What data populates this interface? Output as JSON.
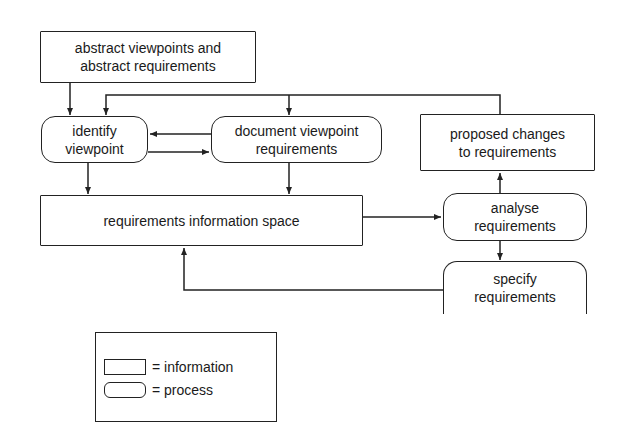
{
  "diagram": {
    "nodes": {
      "abstract": {
        "line1": "abstract viewpoints and",
        "line2": "abstract requirements",
        "kind": "information"
      },
      "identify": {
        "line1": "identify",
        "line2": "viewpoint",
        "kind": "process"
      },
      "document": {
        "line1": "document viewpoint",
        "line2": "requirements",
        "kind": "process"
      },
      "proposed": {
        "line1": "proposed changes",
        "line2": "to requirements",
        "kind": "information"
      },
      "infospace": {
        "line1": "requirements information space",
        "kind": "information"
      },
      "analyse": {
        "line1": "analyse",
        "line2": "requirements",
        "kind": "process"
      },
      "specify": {
        "line1": "specify",
        "line2": "requirements",
        "kind": "process"
      }
    },
    "edges": [
      {
        "from": "abstract viewpoints and abstract requirements",
        "to": "identify viewpoint"
      },
      {
        "from": "proposed changes to requirements",
        "to": "identify viewpoint"
      },
      {
        "from": "proposed changes to requirements",
        "to": "document viewpoint requirements"
      },
      {
        "from": "document viewpoint requirements",
        "to": "identify viewpoint"
      },
      {
        "from": "identify viewpoint",
        "to": "document viewpoint requirements"
      },
      {
        "from": "identify viewpoint",
        "to": "requirements information space"
      },
      {
        "from": "document viewpoint requirements",
        "to": "requirements information space"
      },
      {
        "from": "requirements information space",
        "to": "analyse requirements"
      },
      {
        "from": "analyse requirements",
        "to": "proposed changes to requirements"
      },
      {
        "from": "analyse requirements",
        "to": "specify requirements"
      },
      {
        "from": "specify requirements",
        "to": "requirements information space"
      }
    ],
    "colors": {
      "stroke": "#222222",
      "background": "#ffffff",
      "text": "#1a1a1a"
    }
  },
  "legend": {
    "information_label": "= information",
    "process_label": "= process"
  }
}
